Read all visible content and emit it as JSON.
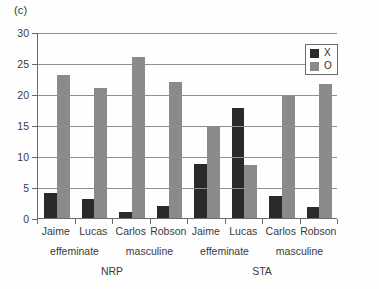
{
  "chart_data": {
    "type": "bar",
    "title": "(c)",
    "xlabel": "",
    "ylabel": "",
    "ylim": [
      0,
      30
    ],
    "ytick_labels": [
      "0",
      "5",
      "10",
      "15",
      "20",
      "25",
      "30"
    ],
    "ytick_values": [
      0,
      5,
      10,
      15,
      20,
      25,
      30
    ],
    "grid": true,
    "legend_position": "top-right",
    "categories": [
      "Jaime",
      "Lucas",
      "Carlos",
      "Robson",
      "Jaime",
      "Lucas",
      "Carlos",
      "Robson"
    ],
    "series": [
      {
        "name": "X",
        "color": "#2a2a2a",
        "values": [
          4.1,
          3.0,
          0.9,
          1.9,
          8.7,
          17.8,
          3.6,
          1.7
        ]
      },
      {
        "name": "O",
        "color": "#8a8a8a",
        "values": [
          23.0,
          21.0,
          26.0,
          22.0,
          14.8,
          8.6,
          19.7,
          21.6
        ]
      }
    ],
    "group_levels": [
      {
        "label": "effeminate",
        "span": [
          0,
          1
        ]
      },
      {
        "label": "masculine",
        "span": [
          2,
          3
        ]
      },
      {
        "label": "effeminate",
        "span": [
          4,
          5
        ]
      },
      {
        "label": "masculine",
        "span": [
          6,
          7
        ]
      }
    ],
    "top_groups": [
      {
        "label": "NRP",
        "span": [
          0,
          3
        ]
      },
      {
        "label": "STA",
        "span": [
          4,
          7
        ]
      }
    ]
  },
  "legend": {
    "items": [
      {
        "label": "X",
        "swatch": "legend-swatch-x"
      },
      {
        "label": "O",
        "swatch": "legend-swatch-o"
      }
    ]
  }
}
